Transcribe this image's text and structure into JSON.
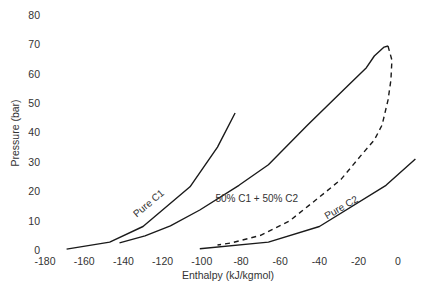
{
  "chart_data": {
    "type": "line",
    "title": "",
    "xlabel": "Enthalpy (kJ/kgmol)",
    "ylabel": "Pressure (bar)",
    "xlim": [
      -180,
      10
    ],
    "ylim": [
      0,
      80
    ],
    "x_ticks": [
      -180,
      -160,
      -140,
      -120,
      -100,
      -80,
      -60,
      -40,
      -20,
      0
    ],
    "y_ticks": [
      0,
      10,
      20,
      30,
      40,
      50,
      60,
      70,
      80
    ],
    "grid": false,
    "legend": "none (inline curve labels)",
    "series": [
      {
        "name": "Pure C1",
        "style": "solid",
        "label": "Pure C1",
        "points": [
          [
            -169,
            0.3
          ],
          [
            -147,
            2.7
          ],
          [
            -130,
            8
          ],
          [
            -106,
            21.5
          ],
          [
            -92,
            35
          ],
          [
            -83,
            46.6
          ]
        ]
      },
      {
        "name": "50% C1 + 50% C2 (bubble curve)",
        "style": "solid",
        "label": "50% C1 + 50% C2",
        "points": [
          [
            -142,
            2.4
          ],
          [
            -129,
            4.8
          ],
          [
            -116,
            8.2
          ],
          [
            -101,
            13.6
          ],
          [
            -81,
            22
          ],
          [
            -66,
            29
          ],
          [
            -46,
            42.5
          ],
          [
            -26,
            55.5
          ],
          [
            -16,
            62
          ],
          [
            -12,
            66
          ],
          [
            -7,
            69
          ],
          [
            -5,
            69.4
          ]
        ]
      },
      {
        "name": "50% C1 + 50% C2 (dew curve)",
        "style": "dashed",
        "label": "",
        "points": [
          [
            -5,
            69.4
          ],
          [
            -3,
            64.6
          ],
          [
            -3.5,
            57.8
          ],
          [
            -5,
            51
          ],
          [
            -8,
            42.5
          ],
          [
            -12,
            37.4
          ],
          [
            -19,
            32
          ],
          [
            -29,
            24
          ],
          [
            -40,
            18
          ],
          [
            -55,
            10
          ],
          [
            -70,
            5
          ],
          [
            -85,
            2.4
          ],
          [
            -92,
            1.7
          ]
        ]
      },
      {
        "name": "Pure C2",
        "style": "solid",
        "label": "Pure C2",
        "points": [
          [
            -101,
            0.4
          ],
          [
            -66,
            2.7
          ],
          [
            -40,
            8
          ],
          [
            -6,
            22
          ],
          [
            9,
            31
          ]
        ]
      }
    ],
    "annotations": [
      {
        "text": "Pure C1",
        "at": [
          -126,
          15
        ],
        "rotation": -40
      },
      {
        "text": "50% C1 + 50% C2",
        "at": [
          -72,
          16.5
        ],
        "rotation": 0
      },
      {
        "text": "Pure C2",
        "at": [
          -28,
          13.5
        ],
        "rotation": -30
      }
    ]
  }
}
